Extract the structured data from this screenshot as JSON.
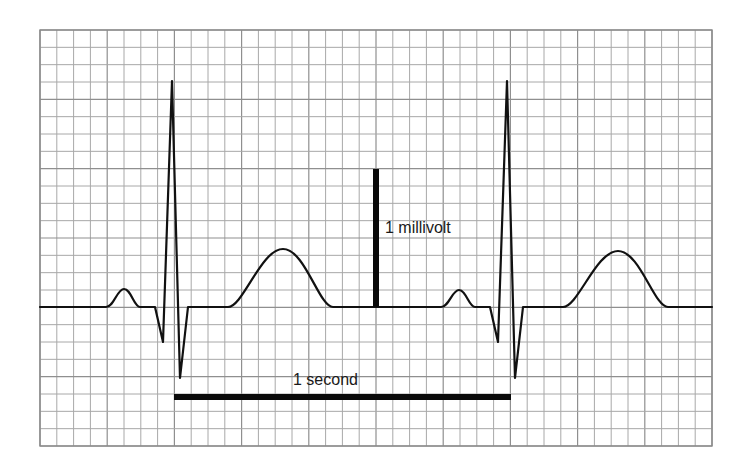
{
  "diagram": {
    "type": "ecg-strip",
    "grid": {
      "left": 40,
      "top": 30,
      "right": 712,
      "bottom": 446,
      "columns": 40,
      "rows": 24,
      "line_color": "#a8a8a8"
    },
    "trace": {
      "color": "#111111",
      "baseline_y": 307,
      "beats": [
        {
          "p_peak": [
            124,
            289
          ],
          "q": [
            163,
            342
          ],
          "r": [
            172,
            81
          ],
          "s": [
            180,
            378
          ],
          "t_peak": [
            283,
            249
          ]
        },
        {
          "p_peak": [
            459,
            290
          ],
          "q": [
            498,
            342
          ],
          "r": [
            507,
            81
          ],
          "s": [
            515,
            378
          ],
          "t_peak": [
            618,
            251
          ]
        }
      ]
    },
    "voltage_scale": {
      "label": "1 millivolt",
      "x": 376,
      "y_top": 169,
      "y_bottom": 307
    },
    "time_scale": {
      "label": "1 second",
      "x_start": 174,
      "x_end": 511,
      "y": 397
    }
  }
}
